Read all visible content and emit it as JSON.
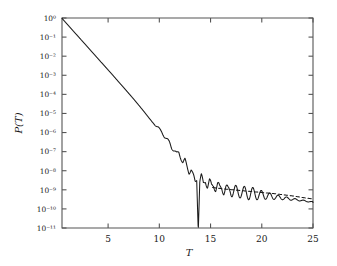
{
  "figure": {
    "background_color": "#ffffff",
    "line_color": "#1a1a1a",
    "axis_color": "#555555"
  },
  "axes": {
    "xlabel": "T",
    "ylabel": "P(T)",
    "x_ticks": [
      "5",
      "10",
      "15",
      "20",
      "25"
    ],
    "y_ticks": [
      "10⁰",
      "10⁻¹",
      "10⁻²",
      "10⁻³",
      "10⁻⁴",
      "10⁻⁵",
      "10⁻⁶",
      "10⁻⁷",
      "10⁻⁸",
      "10⁻⁹",
      "10⁻¹⁰",
      "10⁻¹¹"
    ]
  },
  "chart_data": {
    "type": "line",
    "title": "",
    "xlabel": "T",
    "ylabel": "P(T)",
    "xlim": [
      0.5,
      25
    ],
    "ylim_log10": [
      -11,
      0
    ],
    "yscale": "log",
    "grid": false,
    "legend": "none",
    "x_tick_values": [
      5,
      10,
      15,
      20,
      25
    ],
    "y_tick_exponents": [
      0,
      -1,
      -2,
      -3,
      -4,
      -5,
      -6,
      -7,
      -8,
      -9,
      -10,
      -11
    ],
    "series": [
      {
        "name": "solid-curve",
        "style": "solid",
        "x": [
          0.5,
          1.0,
          1.5,
          2.0,
          2.5,
          3.0,
          3.5,
          4.0,
          4.5,
          5.0,
          5.5,
          6.0,
          6.5,
          7.0,
          7.5,
          8.0,
          8.5,
          9.0,
          9.3,
          9.6,
          9.9,
          10.2,
          10.5,
          10.8,
          11.0,
          11.2,
          11.45,
          11.7,
          11.9,
          12.1,
          12.3,
          12.5,
          12.7,
          12.9,
          13.1,
          13.3,
          13.5,
          13.65,
          13.8,
          13.95,
          14.1,
          14.3,
          14.5,
          14.7,
          14.9,
          15.1,
          15.3,
          15.5,
          15.7,
          15.9,
          16.1,
          16.3,
          16.5,
          16.7,
          16.9,
          17.1,
          17.4,
          17.7,
          18.0,
          18.4,
          18.8,
          19.3,
          19.8,
          20.4,
          21.0,
          21.7,
          22.4,
          23.1,
          23.8,
          24.4,
          25.0
        ],
        "y_log10": [
          -0.02,
          -0.32,
          -0.62,
          -0.92,
          -1.22,
          -1.52,
          -1.82,
          -2.12,
          -2.42,
          -2.72,
          -3.02,
          -3.33,
          -3.63,
          -3.94,
          -4.25,
          -4.57,
          -4.9,
          -5.24,
          -5.45,
          -5.62,
          -5.72,
          -5.95,
          -6.22,
          -6.38,
          -6.52,
          -6.78,
          -6.95,
          -7.12,
          -7.02,
          -7.3,
          -7.58,
          -7.46,
          -7.78,
          -8.05,
          -7.92,
          -8.28,
          -8.62,
          -8.4,
          -11.0,
          -8.55,
          -8.3,
          -8.72,
          -8.46,
          -8.8,
          -8.58,
          -8.86,
          -8.68,
          -8.92,
          -8.76,
          -8.98,
          -8.84,
          -9.04,
          -8.92,
          -9.08,
          -8.98,
          -9.1,
          -9.04,
          -9.14,
          -9.1,
          -9.16,
          -9.19,
          -9.22,
          -9.26,
          -9.3,
          -9.35,
          -9.4,
          -9.45,
          -9.5,
          -9.55,
          -9.6,
          -9.64,
          -9.68
        ]
      },
      {
        "name": "dashed-curve",
        "style": "dashed",
        "x": [
          15.2,
          15.8,
          16.4,
          17.0,
          17.6,
          18.2,
          18.8,
          19.4,
          20.0,
          20.6,
          21.2,
          21.8,
          22.4,
          23.0,
          23.6,
          24.2,
          25.0
        ],
        "y_log10": [
          -8.88,
          -8.92,
          -8.96,
          -8.99,
          -9.02,
          -9.05,
          -9.08,
          -9.11,
          -9.14,
          -9.17,
          -9.2,
          -9.24,
          -9.28,
          -9.32,
          -9.37,
          -9.42,
          -9.48
        ]
      }
    ]
  }
}
